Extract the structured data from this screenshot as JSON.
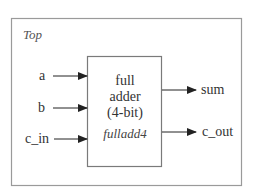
{
  "diagram": {
    "container": {
      "label": "Top"
    },
    "block": {
      "lines": [
        "full",
        "adder",
        "(4-bit)"
      ],
      "module_name": "fulladd4"
    },
    "inputs": [
      {
        "label": "a"
      },
      {
        "label": "b"
      },
      {
        "label": "c_in"
      }
    ],
    "outputs": [
      {
        "label": "sum"
      },
      {
        "label": "c_out"
      }
    ],
    "colors": {
      "outer_border": "#9a9a9a",
      "inner_border": "#7a7a7a",
      "arrow": "#222222",
      "text": "#333333"
    }
  }
}
